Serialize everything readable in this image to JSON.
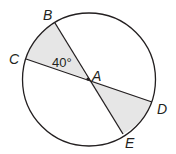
{
  "diagram": {
    "type": "circle-geometry",
    "circle": {
      "cx": 89,
      "cy": 79.5,
      "r": 66.5
    },
    "center": {
      "label": "A",
      "x": 88,
      "y": 79
    },
    "points": [
      {
        "label": "B",
        "x": 55,
        "y": 23
      },
      {
        "label": "C",
        "x": 26,
        "y": 59
      },
      {
        "label": "D",
        "x": 152,
        "y": 102
      },
      {
        "label": "E",
        "x": 123,
        "y": 134
      }
    ],
    "chords": [
      {
        "from": "B",
        "to": "E"
      },
      {
        "from": "C",
        "to": "D"
      }
    ],
    "shaded_sectors": [
      {
        "name": "sector-BAC",
        "between": [
          "B",
          "C"
        ]
      },
      {
        "name": "sector-DAE",
        "between": [
          "D",
          "E"
        ]
      }
    ],
    "angle_label": {
      "text": "40°",
      "vertex": "A",
      "between": [
        "B",
        "C"
      ]
    },
    "labels": {
      "A": "A",
      "B": "B",
      "C": "C",
      "D": "D",
      "E": "E",
      "angle": "40°"
    },
    "colors": {
      "stroke": "#231f20",
      "shade": "#e6e6e6",
      "background": "#ffffff"
    }
  }
}
